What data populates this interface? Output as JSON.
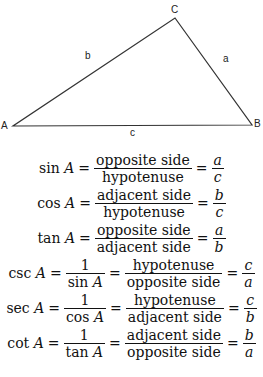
{
  "triangle": {
    "vertices": [
      {
        "name": "A",
        "x": 13,
        "y": 126
      },
      {
        "name": "B",
        "x": 252,
        "y": 125
      },
      {
        "name": "C",
        "x": 175,
        "y": 18
      }
    ],
    "vertex_labels": {
      "A": "A",
      "B": "B",
      "C": "C"
    },
    "side_labels": {
      "a": "a",
      "b": "b",
      "c": "c"
    },
    "stroke_color": "#333333"
  },
  "formulas": [
    {
      "fn": "sin",
      "var": "A",
      "frac1": null,
      "frac2": {
        "num": "opposite side",
        "den": "hypotenuse"
      },
      "result": {
        "num": "a",
        "den": "c"
      }
    },
    {
      "fn": "cos",
      "var": "A",
      "frac1": null,
      "frac2": {
        "num": "adjacent side",
        "den": "hypotenuse"
      },
      "result": {
        "num": "b",
        "den": "c"
      }
    },
    {
      "fn": "tan",
      "var": "A",
      "frac1": null,
      "frac2": {
        "num": "opposite side",
        "den": "adjacent side"
      },
      "result": {
        "num": "a",
        "den": "b"
      }
    },
    {
      "fn": "csc",
      "var": "A",
      "frac1": {
        "num": "1",
        "den_fn": "sin",
        "den_var": "A"
      },
      "frac2": {
        "num": "hypotenuse",
        "den": "opposite side"
      },
      "result": {
        "num": "c",
        "den": "a"
      }
    },
    {
      "fn": "sec",
      "var": "A",
      "frac1": {
        "num": "1",
        "den_fn": "cos",
        "den_var": "A"
      },
      "frac2": {
        "num": "hypotenuse",
        "den": "adjacent side"
      },
      "result": {
        "num": "c",
        "den": "b"
      }
    },
    {
      "fn": "cot",
      "var": "A",
      "frac1": {
        "num": "1",
        "den_fn": "tan",
        "den_var": "A"
      },
      "frac2": {
        "num": "adjacent side",
        "den": "opposite side"
      },
      "result": {
        "num": "b",
        "den": "a"
      }
    }
  ],
  "symbols": {
    "equals": "="
  }
}
